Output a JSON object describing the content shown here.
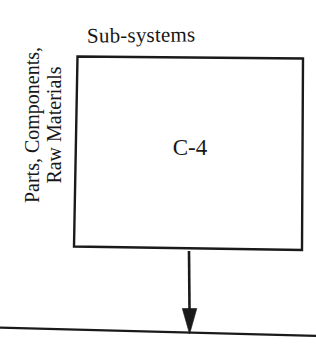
{
  "diagram": {
    "background_color": "#ffffff",
    "ink_color": "#1a1a1a",
    "top_label": "Sub-systems",
    "side_label": {
      "line1": "Parts, Components,",
      "line2": "Raw Materials"
    },
    "box": {
      "label": "C-4",
      "border_color": "#1a1a1a",
      "fill_color": "#ffffff"
    },
    "arrow": {
      "direction": "down",
      "color": "#1a1a1a"
    },
    "baseline_rule": {
      "color": "#1a1a1a"
    }
  }
}
